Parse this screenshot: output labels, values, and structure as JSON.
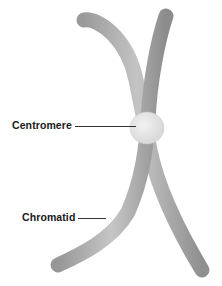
{
  "diagram": {
    "labels": {
      "centromere": "Centromere",
      "chromatid": "Chromatid"
    },
    "colors": {
      "background": "#ffffff",
      "chromatid_fill": "#a9a9a9",
      "chromatid_highlight": "#cfcfcf",
      "chromatid_shadow": "#8a8a8a",
      "centromere_fill": "#e6e6e6",
      "label_text": "#1a1a1a",
      "leader_line": "#333333"
    }
  }
}
